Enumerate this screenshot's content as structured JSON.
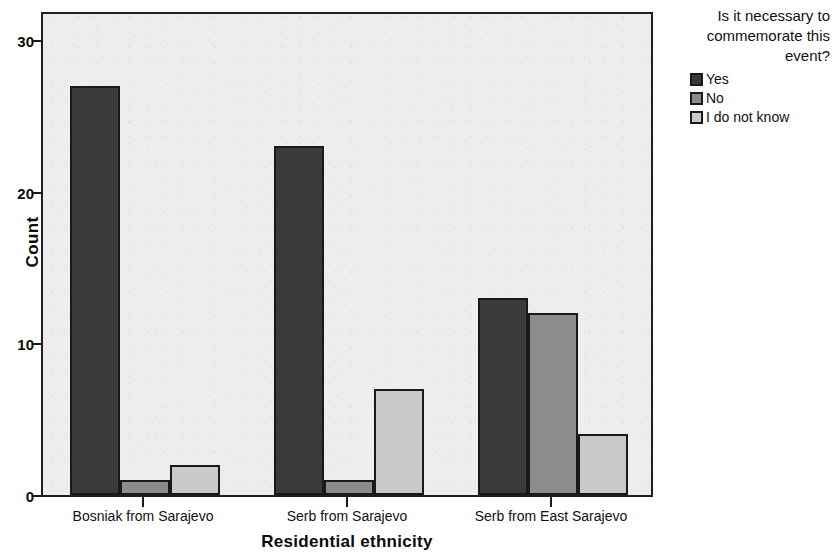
{
  "chart_data": {
    "type": "bar",
    "title": "",
    "xlabel": "Residential ethnicity",
    "ylabel": "Count",
    "categories": [
      "Bosniak from Sarajevo",
      "Serb from Sarajevo",
      "Serb from East Sarajevo"
    ],
    "series": [
      {
        "name": "Yes",
        "values": [
          27,
          23,
          13
        ],
        "color": "#3a3a3a"
      },
      {
        "name": "No",
        "values": [
          1,
          1,
          12
        ],
        "color": "#8c8c8c"
      },
      {
        "name": "I do not know",
        "values": [
          2,
          7,
          4
        ],
        "color": "#c9c9c9"
      }
    ],
    "legend_title": "Is it necessary to commemorate this event?",
    "legend_position": "right",
    "ylim": [
      0,
      32
    ],
    "yticks": [
      0,
      10,
      20,
      30
    ],
    "ytick_labels": [
      "0",
      "10",
      "20",
      "30"
    ],
    "grid": false,
    "plot_background": "#ededed",
    "axis_color": "#1a1a1a"
  },
  "axes": {
    "y_title": "Count",
    "x_title": "Residential ethnicity"
  }
}
